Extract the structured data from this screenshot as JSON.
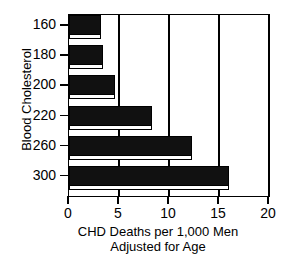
{
  "chart_data": {
    "type": "bar",
    "orientation": "horizontal",
    "title": "",
    "xlabel": "CHD Deaths per 1,000 Men Adjusted for Age",
    "xlabel_lines": [
      "CHD Deaths per 1,000 Men",
      "Adjusted for Age"
    ],
    "ylabel": "Blood Cholesterol",
    "categories": [
      "160",
      "180",
      "200",
      "220",
      "260",
      "300"
    ],
    "values": [
      3.2,
      3.4,
      4.6,
      8.3,
      12.3,
      16.0
    ],
    "xlim": [
      0,
      20
    ],
    "xticks": [
      0,
      5,
      10,
      15,
      20
    ],
    "xtick_labels": [
      "0",
      "5",
      "10",
      "15",
      "20"
    ],
    "grid": "vertical",
    "legend": "none",
    "bar_fill_color": "#111111",
    "bar_edge_color": "#000000",
    "bar_shadow_color": "#ffffff",
    "axis_color": "#000000",
    "background_color": "#ffffff"
  }
}
